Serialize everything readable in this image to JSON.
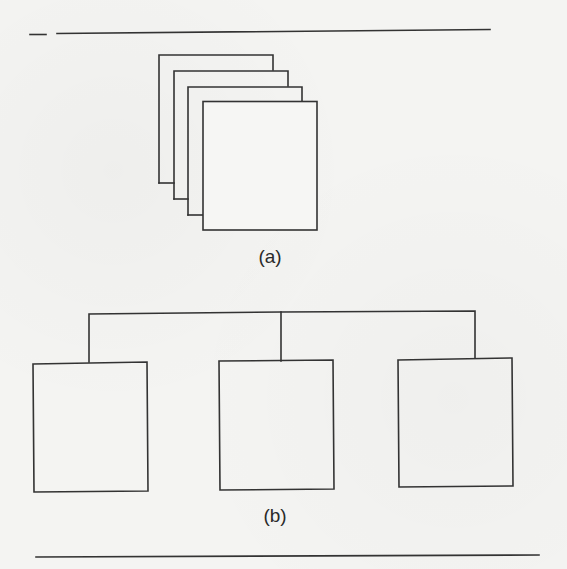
{
  "figure": {
    "parts": [
      {
        "id": "a",
        "label": "(a)",
        "description": "stack of four overlapping sheets",
        "sheet_count": 4
      },
      {
        "id": "b",
        "label": "(b)",
        "description": "tree: one connector bar branching to three boxes",
        "child_count": 3
      }
    ]
  },
  "colors": {
    "line": "#333333",
    "paper": "#f4f4f2",
    "text": "#2a2a2a"
  }
}
